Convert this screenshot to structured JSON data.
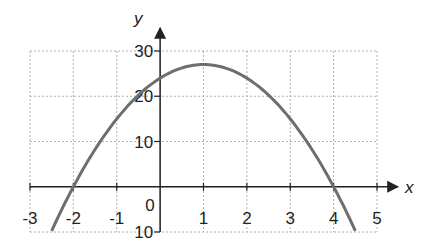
{
  "chart_data": {
    "type": "line",
    "title": "",
    "xlabel": "x",
    "ylabel": "y",
    "xlim": [
      -3,
      5
    ],
    "ylim": [
      -10,
      30
    ],
    "grid": true,
    "x_ticks": [
      "-3",
      "-2",
      "-1",
      "0",
      "1",
      "2",
      "3",
      "4",
      "5"
    ],
    "y_ticks": [
      "10",
      "10",
      "20",
      "30"
    ],
    "y_tick_values": [
      -10,
      10,
      20,
      30
    ],
    "origin_label": "0",
    "series": [
      {
        "name": "y = -3x² + 6x + 24",
        "color": "#6e6e6e",
        "x": [
          -2.5,
          -2,
          -1,
          0,
          1,
          2,
          3,
          4,
          4.5
        ],
        "y": [
          -6.75,
          0,
          15,
          24,
          27,
          24,
          15,
          0,
          -6.75
        ]
      }
    ],
    "annotations": {
      "roots": [
        -2,
        4
      ],
      "vertex": [
        1,
        27
      ],
      "y_intercept": 24
    }
  },
  "colors": {
    "axis": "#222222",
    "grid": "#b0b0b0",
    "curve": "#6e6e6e"
  }
}
